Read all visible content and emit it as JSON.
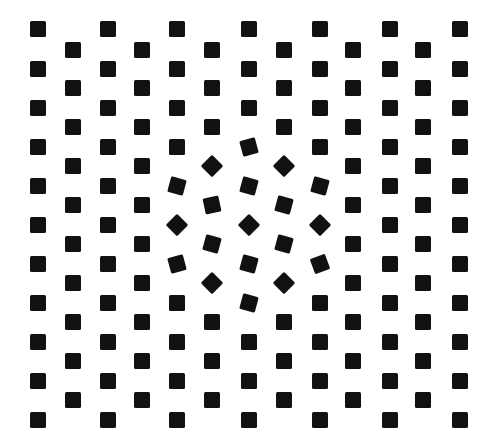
{
  "figure": {
    "background": "#ffffff",
    "square_color": "#111111",
    "square_size": 16
  },
  "grid": {
    "columns_a_x": [
      38,
      108,
      177,
      249,
      320,
      390,
      460
    ],
    "rows_a_y": [
      29,
      69,
      108,
      147,
      186,
      225,
      264,
      303,
      342,
      381,
      420
    ],
    "columns_b_x": [
      73,
      142,
      212,
      284,
      353,
      423
    ],
    "rows_b_y": [
      50,
      88,
      127,
      166,
      205,
      244,
      283,
      322,
      361,
      400
    ]
  },
  "rotations": [
    {
      "x": 249,
      "y": 147,
      "deg": -15
    },
    {
      "x": 212,
      "y": 166,
      "deg": 45
    },
    {
      "x": 284,
      "y": 166,
      "deg": 45
    },
    {
      "x": 177,
      "y": 186,
      "deg": 15
    },
    {
      "x": 249,
      "y": 186,
      "deg": 15
    },
    {
      "x": 320,
      "y": 186,
      "deg": 15
    },
    {
      "x": 212,
      "y": 205,
      "deg": -12
    },
    {
      "x": 284,
      "y": 205,
      "deg": 15
    },
    {
      "x": 177,
      "y": 225,
      "deg": 45
    },
    {
      "x": 249,
      "y": 225,
      "deg": 45
    },
    {
      "x": 320,
      "y": 225,
      "deg": 45
    },
    {
      "x": 212,
      "y": 244,
      "deg": 15
    },
    {
      "x": 284,
      "y": 244,
      "deg": 15
    },
    {
      "x": 177,
      "y": 264,
      "deg": -15
    },
    {
      "x": 249,
      "y": 264,
      "deg": 15
    },
    {
      "x": 320,
      "y": 264,
      "deg": -20
    },
    {
      "x": 212,
      "y": 283,
      "deg": 45
    },
    {
      "x": 284,
      "y": 283,
      "deg": 45
    },
    {
      "x": 249,
      "y": 303,
      "deg": 15
    }
  ]
}
